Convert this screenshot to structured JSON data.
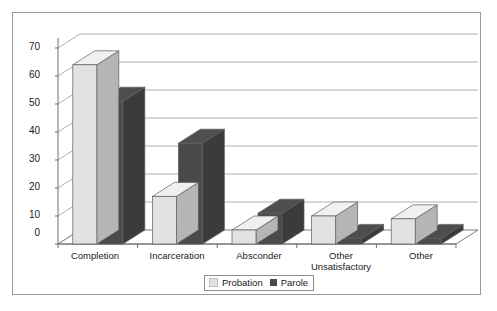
{
  "chart_data": {
    "type": "bar",
    "title": "",
    "subtitle": "",
    "xlabel": "",
    "ylabel": "",
    "ylim": [
      0,
      70
    ],
    "ytick_step": 10,
    "yticks": [
      0,
      10,
      20,
      30,
      40,
      50,
      60,
      70
    ],
    "grid": true,
    "three_d": true,
    "legend_position": "bottom-center",
    "categories": [
      "Completion",
      "Incarceration",
      "Absconder",
      "Other Unsatisfactory",
      "Other"
    ],
    "series": [
      {
        "name": "Probation",
        "color": "#e2e2e2",
        "values": [
          64,
          17,
          5,
          10,
          9
        ]
      },
      {
        "name": "Parole",
        "color": "#4a4a4a",
        "values": [
          51,
          36,
          11,
          2,
          2
        ]
      }
    ]
  },
  "axis": {
    "ytick_labels": [
      "70",
      "60",
      "50",
      "40",
      "30",
      "20",
      "10",
      "0"
    ]
  },
  "category_labels": [
    {
      "line1": "Completion",
      "line2": ""
    },
    {
      "line1": "Incarceration",
      "line2": ""
    },
    {
      "line1": "Absconder",
      "line2": ""
    },
    {
      "line1": "Other",
      "line2": "Unsatisfactory"
    },
    {
      "line1": "Other",
      "line2": ""
    }
  ],
  "legend": {
    "items": [
      {
        "label": "Probation",
        "color": "#e2e2e2"
      },
      {
        "label": "Parole",
        "color": "#4a4a4a"
      }
    ]
  },
  "colors": {
    "probation": "#e2e2e2",
    "parole": "#4a4a4a",
    "grid": "#9b9b9b",
    "axis": "#6f6f6f",
    "border": "#9a9a9a",
    "text": "#1a1a1a"
  }
}
